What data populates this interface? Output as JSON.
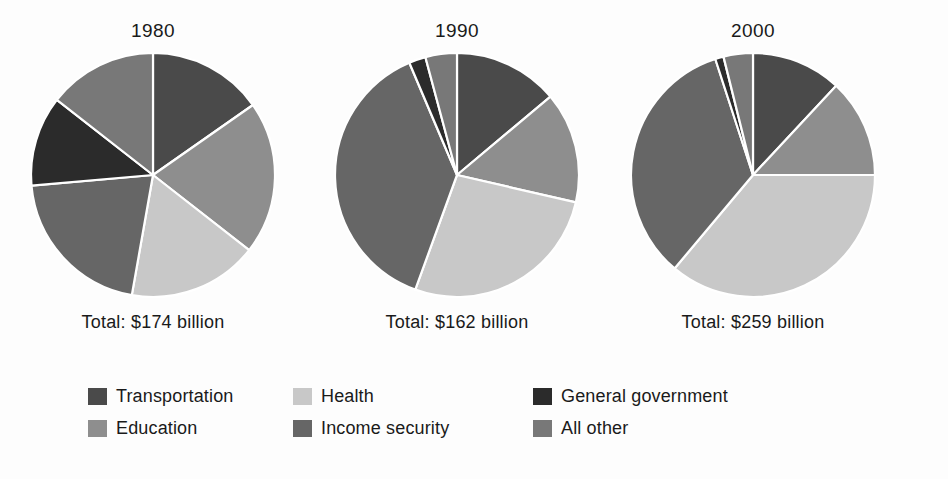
{
  "figure": {
    "background_color": "#fdfdfd",
    "text_color": "#1a1a1a"
  },
  "panels": [
    {
      "year": "1980",
      "total": "Total: $174 billion"
    },
    {
      "year": "1990",
      "total": "Total: $162 billion"
    },
    {
      "year": "2000",
      "total": "Total: $259 billion"
    }
  ],
  "legend": {
    "items": [
      {
        "label": "Transportation",
        "color": "#4a4a4a",
        "swatch_name": "swatch-transportation"
      },
      {
        "label": "Health",
        "color": "#c8c8c8",
        "swatch_name": "swatch-health"
      },
      {
        "label": "General government",
        "color": "#2b2b2b",
        "swatch_name": "swatch-general-government"
      },
      {
        "label": "Education",
        "color": "#8e8e8e",
        "swatch_name": "swatch-education"
      },
      {
        "label": "Income security",
        "color": "#666666",
        "swatch_name": "swatch-income-security"
      },
      {
        "label": "All other",
        "color": "#787878",
        "swatch_name": "swatch-all-other"
      }
    ]
  },
  "chart_data": {
    "type": "pie",
    "title": "",
    "subtitle": "",
    "xlabel": "",
    "ylabel": "",
    "legend_position": "bottom",
    "grid": false,
    "value_unit": "percent of total",
    "slice_order_clockwise_from_top": [
      "Transportation",
      "Education",
      "Health",
      "Income security",
      "General government",
      "All other"
    ],
    "category_colors": {
      "Transportation": "#4a4a4a",
      "Education": "#8e8e8e",
      "Health": "#c8c8c8",
      "Income security": "#666666",
      "General government": "#2b2b2b",
      "All other": "#787878"
    },
    "charts": [
      {
        "name": "1980",
        "title": "1980",
        "total_label": "Total: $174 billion",
        "total_value": 174,
        "total_unit": "billion dollars",
        "categories": [
          "Transportation",
          "Education",
          "Health",
          "Income security",
          "General government",
          "All other"
        ],
        "angles_deg": [
          55,
          73,
          62,
          75,
          43,
          52
        ],
        "percentages": [
          15.3,
          20.3,
          17.2,
          20.8,
          11.9,
          14.4
        ]
      },
      {
        "name": "1990",
        "title": "1990",
        "total_label": "Total: $162 billion",
        "total_value": 162,
        "total_unit": "billion dollars",
        "categories": [
          "Transportation",
          "Education",
          "Health",
          "Income security",
          "General government",
          "All other"
        ],
        "angles_deg": [
          50,
          53,
          97,
          137,
          8,
          15
        ],
        "percentages": [
          13.9,
          14.7,
          26.9,
          38.1,
          2.2,
          4.2
        ]
      },
      {
        "name": "2000",
        "title": "2000",
        "total_label": "Total: $259 billion",
        "total_value": 259,
        "total_unit": "billion dollars",
        "categories": [
          "Transportation",
          "Education",
          "Health",
          "Income security",
          "General government",
          "All other"
        ],
        "angles_deg": [
          43,
          47,
          130,
          122,
          4,
          14
        ],
        "percentages": [
          11.9,
          13.1,
          36.1,
          33.9,
          1.1,
          3.9
        ]
      }
    ]
  }
}
